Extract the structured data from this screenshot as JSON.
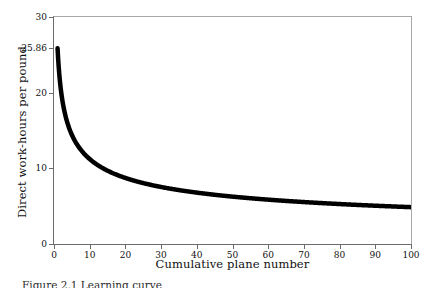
{
  "figure": {
    "caption_fragment": "Figure 2.1 Learning curve"
  },
  "chart_data": {
    "type": "line",
    "title": "",
    "xlabel": "Cumulative plane number",
    "ylabel": "Direct work-hours per pound",
    "xlim": [
      0,
      100
    ],
    "ylim": [
      0,
      30
    ],
    "grid": false,
    "legend": null,
    "xticks": [
      0,
      10,
      20,
      30,
      40,
      50,
      60,
      70,
      80,
      90,
      100
    ],
    "xtick_labels": [
      "0",
      "10",
      "20",
      "30",
      "40",
      "50",
      "60",
      "70",
      "80",
      "90",
      "100"
    ],
    "yticks": [
      0,
      10,
      20,
      25.86,
      30
    ],
    "ytick_labels": [
      "0",
      "10",
      "20",
      "25.86",
      "30"
    ],
    "line_color": "#000000",
    "line_width": 1.6,
    "series": [
      {
        "name": "Direct work-hours per pound",
        "formula": "y = 25.86 * n^(-0.375)",
        "x": [
          1,
          2,
          3,
          4,
          5,
          6,
          7,
          8,
          9,
          10,
          12,
          14,
          16,
          18,
          20,
          25,
          30,
          35,
          40,
          45,
          50,
          55,
          60,
          65,
          70,
          75,
          80,
          85,
          90,
          95,
          100
        ],
        "values": [
          25.86,
          19.94,
          17.04,
          15.38,
          14.25,
          13.14,
          12.45,
          11.86,
          11.37,
          10.93,
          10.22,
          9.64,
          9.15,
          8.77,
          8.42,
          7.8,
          7.31,
          6.93,
          6.62,
          6.36,
          6.13,
          5.94,
          5.76,
          5.61,
          5.47,
          5.35,
          5.23,
          5.13,
          5.03,
          4.95,
          4.87
        ]
      }
    ],
    "annotations": [
      {
        "label": "25.86",
        "note": "first-unit value marked on y axis"
      }
    ]
  }
}
